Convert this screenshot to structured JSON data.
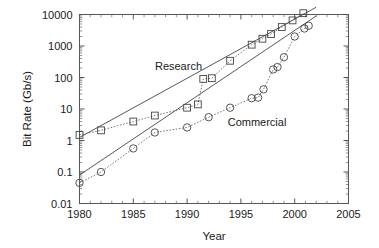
{
  "chart_data": {
    "type": "scatter",
    "title": "",
    "subtitle": "",
    "xlabel": "Year",
    "ylabel": "Bit Rate (Gb/s)",
    "xlim": [
      1980,
      2005
    ],
    "ylim": [
      0.01,
      10000
    ],
    "yscale": "log",
    "xscale": "linear",
    "grid": false,
    "legend_position": "inline-annotations",
    "xticks": [
      1980,
      1985,
      1990,
      1995,
      2000,
      2005
    ],
    "xtick_labels": [
      "1980",
      "1985",
      "1990",
      "1995",
      "2000",
      "2005"
    ],
    "yticks": [
      0.01,
      0.1,
      1,
      10,
      100,
      1000,
      10000
    ],
    "ytick_labels": [
      "0.01",
      "0.1",
      "1",
      "10",
      "100",
      "1000",
      "10000"
    ],
    "annotations": [
      {
        "text": "Research",
        "x": 1989.2,
        "y": 230
      },
      {
        "text": "Commercial",
        "x": 1996.5,
        "y": 4.0
      }
    ],
    "series": [
      {
        "name": "Research",
        "marker": "square",
        "points": [
          {
            "x": 1980.0,
            "y": 1.5
          },
          {
            "x": 1982.0,
            "y": 2.1
          },
          {
            "x": 1985.0,
            "y": 4.0
          },
          {
            "x": 1987.0,
            "y": 6.2
          },
          {
            "x": 1990.0,
            "y": 11.0
          },
          {
            "x": 1991.0,
            "y": 14.0
          },
          {
            "x": 1991.5,
            "y": 90.0
          },
          {
            "x": 1992.3,
            "y": 95.0
          },
          {
            "x": 1994.0,
            "y": 340.0
          },
          {
            "x": 1996.0,
            "y": 1100.0
          },
          {
            "x": 1997.0,
            "y": 1700.0
          },
          {
            "x": 1997.8,
            "y": 2400.0
          },
          {
            "x": 1998.8,
            "y": 4000.0
          },
          {
            "x": 1999.8,
            "y": 6500.0
          },
          {
            "x": 2000.8,
            "y": 11000.0
          }
        ],
        "fit": {
          "type": "log-linear",
          "from": {
            "x": 1980,
            "y": 1.25
          },
          "to": {
            "x": 2002.0,
            "y": 17000
          }
        }
      },
      {
        "name": "Commercial",
        "marker": "circle",
        "points": [
          {
            "x": 1980.0,
            "y": 0.045
          },
          {
            "x": 1982.0,
            "y": 0.1
          },
          {
            "x": 1985.0,
            "y": 0.56
          },
          {
            "x": 1987.0,
            "y": 1.8
          },
          {
            "x": 1990.0,
            "y": 2.6
          },
          {
            "x": 1992.0,
            "y": 5.5
          },
          {
            "x": 1994.0,
            "y": 11.0
          },
          {
            "x": 1996.0,
            "y": 22.0
          },
          {
            "x": 1996.6,
            "y": 23.0
          },
          {
            "x": 1997.1,
            "y": 42.0
          },
          {
            "x": 1998.0,
            "y": 180.0
          },
          {
            "x": 1998.4,
            "y": 215.0
          },
          {
            "x": 1999.0,
            "y": 440.0
          },
          {
            "x": 2000.0,
            "y": 2000.0
          },
          {
            "x": 2000.9,
            "y": 3600.0
          },
          {
            "x": 2001.3,
            "y": 4400.0
          }
        ],
        "fit": {
          "type": "log-linear",
          "from": {
            "x": 1980,
            "y": 0.08
          },
          "to": {
            "x": 2002.0,
            "y": 9000
          }
        }
      }
    ]
  }
}
